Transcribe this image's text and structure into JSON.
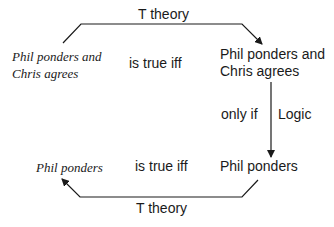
{
  "top": {
    "left_sentence_line1": "Phil ponders and",
    "left_sentence_line2": "Chris agrees",
    "relation": "is true iff",
    "right_sentence_line1": "Phil ponders and",
    "right_sentence_line2": "Chris agrees",
    "arrow_label": "T theory"
  },
  "middle": {
    "relation": "only if",
    "arrow_label": "Logic"
  },
  "bottom": {
    "left_sentence": "Phil ponders",
    "relation": "is true iff",
    "right_sentence": "Phil ponders",
    "arrow_label": "T theory"
  }
}
